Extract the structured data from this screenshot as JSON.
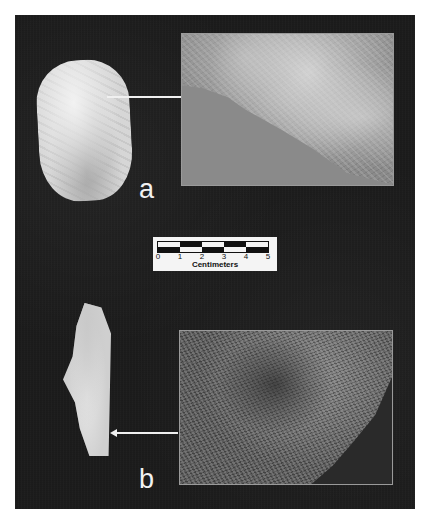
{
  "figure": {
    "panel_a": {
      "label": "a",
      "artifact": "flaked stone scraper (artifact a)",
      "inset": "magnified edge micrograph a"
    },
    "panel_b": {
      "label": "b",
      "artifact": "elongated flake (artifact b)",
      "inset": "magnified surface micrograph b"
    },
    "scale_bar": {
      "ticks": [
        "0",
        "1",
        "2",
        "3",
        "4",
        "5"
      ],
      "unit": "Centimeters",
      "top_row": [
        "white",
        "black",
        "white",
        "black",
        "white"
      ],
      "bottom_row": [
        "black",
        "white",
        "black",
        "white",
        "black"
      ]
    },
    "colors": {
      "panel_background": "#1c1c1c",
      "page_background": "#ffffff",
      "label_color": "#f2f2f2"
    }
  }
}
